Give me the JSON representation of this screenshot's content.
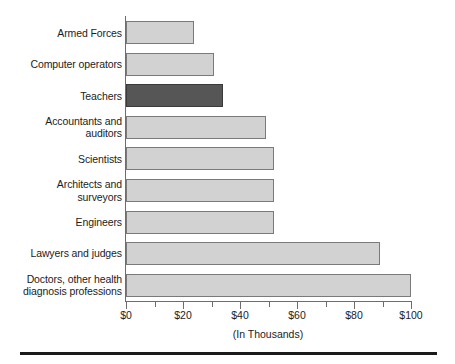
{
  "chart_data": {
    "type": "bar",
    "orientation": "horizontal",
    "title": "",
    "subtitle": "",
    "xlabel": "(In Thousands)",
    "ylabel": "",
    "xlim": [
      0,
      100
    ],
    "xticks": [
      0,
      20,
      40,
      60,
      80,
      100
    ],
    "xtick_labels": [
      "$0",
      "$20",
      "$40",
      "$60",
      "$80",
      "$100"
    ],
    "minor_tick_step": 10,
    "grid": false,
    "legend": null,
    "categories": [
      "Armed Forces",
      "Computer operators",
      "Teachers",
      "Accountants and\nauditors",
      "Scientists",
      "Architects and\nsurveyors",
      "Engineers",
      "Lawyers and judges",
      "Doctors, other health\ndiagnosis professions"
    ],
    "values": [
      24,
      31,
      34,
      49,
      52,
      52,
      52,
      89,
      100
    ],
    "highlight_index": 2,
    "colors": {
      "bar_fill": "#d2d2d2",
      "bar_stroke": "#7a7a7a",
      "highlight_fill": "#565656",
      "highlight_stroke": "#3a3a3a",
      "axis": "#6d6d6d",
      "text": "#1c1c1c",
      "rule": "#1a1a1a"
    },
    "bars": [
      {
        "label": "Armed Forces",
        "value": 24,
        "highlight": false
      },
      {
        "label": "Computer operators",
        "value": 31,
        "highlight": false
      },
      {
        "label": "Teachers",
        "value": 34,
        "highlight": true
      },
      {
        "label": "Accountants and\nauditors",
        "value": 49,
        "highlight": false
      },
      {
        "label": "Scientists",
        "value": 52,
        "highlight": false
      },
      {
        "label": "Architects and\nsurveyors",
        "value": 52,
        "highlight": false
      },
      {
        "label": "Engineers",
        "value": 52,
        "highlight": false
      },
      {
        "label": "Lawyers and judges",
        "value": 89,
        "highlight": false
      },
      {
        "label": "Doctors, other health\ndiagnosis professions",
        "value": 100,
        "highlight": false
      }
    ]
  }
}
